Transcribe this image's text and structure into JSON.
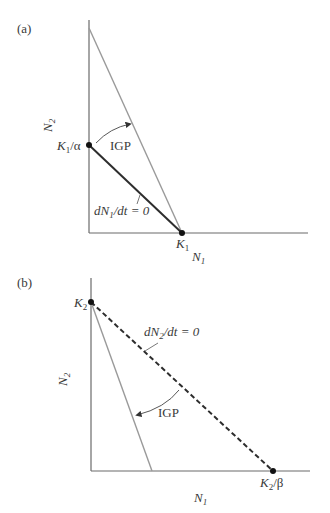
{
  "panels": [
    {
      "id": "a",
      "label": "(a)",
      "x_axis_label": "N",
      "x_axis_sub": "1",
      "y_axis_label": "N",
      "y_axis_sub": "2",
      "points": {
        "k1_alpha": {
          "main": "K",
          "sub": "1",
          "rest": "/α"
        },
        "k1": {
          "main": "K",
          "sub": "1"
        }
      },
      "isocline_label": {
        "pre": "dN",
        "sub": "1",
        "post": "/dt = 0"
      },
      "arrow_label": "IGP"
    },
    {
      "id": "b",
      "label": "(b)",
      "x_axis_label": "N",
      "x_axis_sub": "1",
      "y_axis_label": "N",
      "y_axis_sub": "2",
      "points": {
        "k2": {
          "main": "K",
          "sub": "2"
        },
        "k2_beta": {
          "main": "K",
          "sub": "2",
          "rest": "/β"
        }
      },
      "isocline_label": {
        "pre": "dN",
        "sub": "2",
        "post": "/dt = 0"
      },
      "arrow_label": "IGP"
    }
  ],
  "colors": {
    "axis": "#6b6b6b",
    "gray_line": "#9a9a9a",
    "isocline": "#2d2d2d"
  }
}
